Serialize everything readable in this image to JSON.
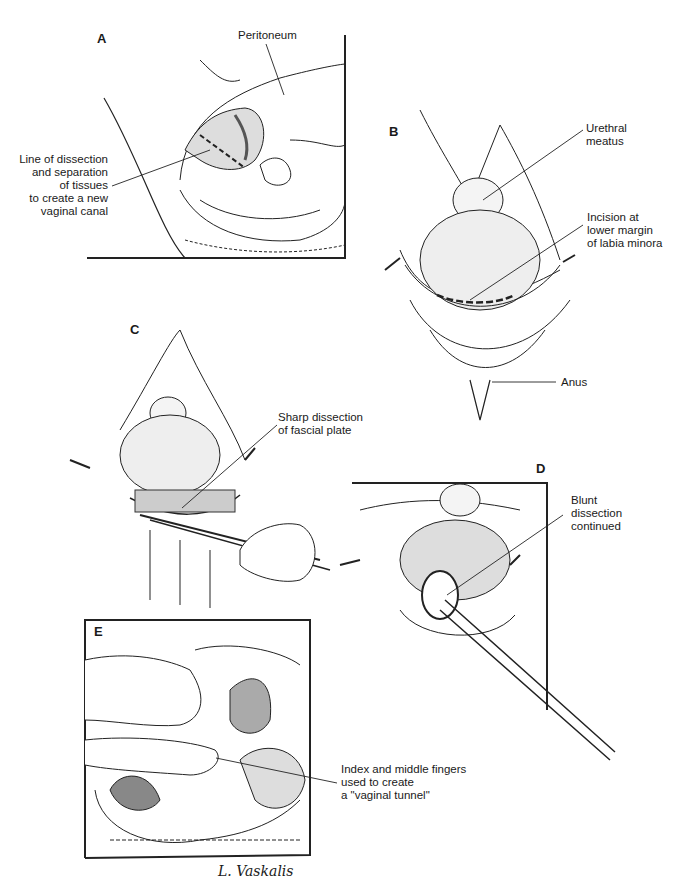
{
  "figure": {
    "panels": [
      {
        "id": "A",
        "letter": "A",
        "description": "Sagittal pelvic view showing line of dissection",
        "labels": [
          {
            "text": "Peritoneum"
          },
          {
            "text": "Line of dissection\nand separation\nof tissues\nto create a new\nvaginal canal"
          }
        ]
      },
      {
        "id": "B",
        "letter": "B",
        "description": "Perineal view with labia retracted",
        "labels": [
          {
            "text": "Urethral\nmeatus"
          },
          {
            "text": "Incision at\nlower margin\nof labia minora"
          },
          {
            "text": "Anus"
          }
        ]
      },
      {
        "id": "C",
        "letter": "C",
        "description": "Sharp dissection with scissors",
        "labels": [
          {
            "text": "Sharp dissection\nof fascial plate"
          }
        ]
      },
      {
        "id": "D",
        "letter": "D",
        "description": "Blunt dissection with forceps",
        "labels": [
          {
            "text": "Blunt\ndissection\ncontinued"
          }
        ]
      },
      {
        "id": "E",
        "letter": "E",
        "description": "Sagittal view with fingers creating tunnel",
        "labels": [
          {
            "text": "Index and middle fingers\nused to create\na \"vaginal tunnel\""
          }
        ]
      }
    ],
    "signature": "L. Vaskalis"
  }
}
